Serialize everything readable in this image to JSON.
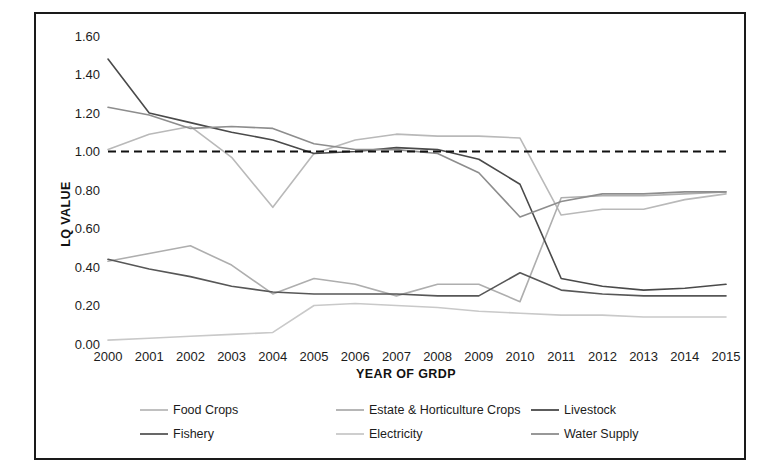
{
  "chart_data": {
    "type": "line",
    "title": "",
    "xlabel": "YEAR OF GRDP",
    "ylabel": "LQ VALUE",
    "grid": false,
    "legend_position": "bottom",
    "ylim": [
      0.0,
      1.6
    ],
    "yticks": [
      "0.00",
      "0.20",
      "0.40",
      "0.60",
      "0.80",
      "1.00",
      "1.20",
      "1.40",
      "1.60"
    ],
    "ytick_values": [
      0.0,
      0.2,
      0.4,
      0.6,
      0.8,
      1.0,
      1.2,
      1.4,
      1.6
    ],
    "categories": [
      "2000",
      "2001",
      "2002",
      "2003",
      "2004",
      "2005",
      "2006",
      "2007",
      "2008",
      "2009",
      "2010",
      "2011",
      "2012",
      "2013",
      "2014",
      "2015"
    ],
    "reference_line": {
      "name": "LQ = 1 threshold",
      "value": 1.0,
      "style": "dashed",
      "color": "#111111"
    },
    "series": [
      {
        "name": "Food Crops",
        "color": "#b9b9b9",
        "values": [
          1.01,
          1.09,
          1.13,
          0.97,
          0.71,
          0.99,
          1.06,
          1.09,
          1.08,
          1.08,
          1.07,
          0.67,
          0.7,
          0.7,
          0.75,
          0.78
        ]
      },
      {
        "name": "Estate & Horticulture Crops",
        "color": "#aeaeae",
        "values": [
          0.43,
          0.47,
          0.51,
          0.41,
          0.26,
          0.34,
          0.31,
          0.25,
          0.31,
          0.31,
          0.22,
          0.76,
          0.77,
          0.77,
          0.78,
          0.79
        ]
      },
      {
        "name": "Livestock",
        "color": "#4a4a4a",
        "values": [
          1.48,
          1.2,
          1.15,
          1.1,
          1.06,
          0.99,
          1.0,
          1.02,
          1.01,
          0.96,
          0.83,
          0.34,
          0.3,
          0.28,
          0.29,
          0.31
        ]
      },
      {
        "name": "Fishery",
        "color": "#575757",
        "values": [
          0.44,
          0.39,
          0.35,
          0.3,
          0.27,
          0.26,
          0.26,
          0.26,
          0.25,
          0.25,
          0.37,
          0.28,
          0.26,
          0.25,
          0.25,
          0.25
        ]
      },
      {
        "name": "Electricity",
        "color": "#c9c9c9",
        "values": [
          0.02,
          0.03,
          0.04,
          0.05,
          0.06,
          0.2,
          0.21,
          0.2,
          0.19,
          0.17,
          0.16,
          0.15,
          0.15,
          0.14,
          0.14,
          0.14
        ]
      },
      {
        "name": "Water Supply",
        "color": "#8d8d8d",
        "values": [
          1.23,
          1.19,
          1.12,
          1.13,
          1.12,
          1.04,
          1.01,
          1.01,
          0.99,
          0.89,
          0.66,
          0.74,
          0.78,
          0.78,
          0.79,
          0.79
        ]
      }
    ]
  },
  "legend": {
    "items": [
      {
        "label": "Food Crops"
      },
      {
        "label": "Estate & Horticulture Crops"
      },
      {
        "label": "Livestock"
      },
      {
        "label": "Fishery"
      },
      {
        "label": "Electricity"
      },
      {
        "label": "Water Supply"
      }
    ]
  }
}
